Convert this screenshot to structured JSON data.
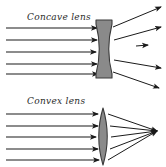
{
  "canvas": {
    "width": 166,
    "height": 167,
    "background": "#ffffff"
  },
  "style": {
    "ray_color": "#1a1a1a",
    "lens_fill": "#8a8a8a",
    "lens_stroke": "#3a3a3a",
    "label_color": "#2b2b2b"
  },
  "panels": [
    {
      "id": "concave",
      "label": "Concave lens",
      "lens_type": "biconcave",
      "behaviour": "diverging",
      "lens": {
        "x": 96,
        "y": 20,
        "width": 16,
        "height": 58
      },
      "incident_rays": [
        {
          "y": 28,
          "x_start": 6,
          "x_end": 97
        },
        {
          "y": 40,
          "x_start": 6,
          "x_end": 97
        },
        {
          "y": 52,
          "x_start": 6,
          "x_end": 96
        },
        {
          "y": 64,
          "x_start": 6,
          "x_end": 97
        },
        {
          "y": 74,
          "x_start": 6,
          "x_end": 98
        }
      ],
      "emergent_rays": [
        {
          "x1": 113,
          "y1": 27,
          "x2": 161,
          "y2": 7
        },
        {
          "x1": 114,
          "y1": 40,
          "x2": 161,
          "y2": 27
        },
        {
          "x1": 116,
          "y1": 47,
          "x2": 148,
          "y2": 45
        },
        {
          "x1": 114,
          "y1": 60,
          "x2": 161,
          "y2": 68
        },
        {
          "x1": 113,
          "y1": 72,
          "x2": 159,
          "y2": 88
        }
      ]
    },
    {
      "id": "convex",
      "label": "Convex lens",
      "lens_type": "biconvex",
      "behaviour": "converging",
      "lens": {
        "x": 95,
        "y": 108,
        "width": 16,
        "height": 57
      },
      "focal_point": {
        "x": 157,
        "y": 131
      },
      "incident_rays": [
        {
          "y": 114,
          "x_start": 6,
          "x_end": 98
        },
        {
          "y": 126,
          "x_start": 6,
          "x_end": 98
        },
        {
          "y": 137,
          "x_start": 6,
          "x_end": 96
        },
        {
          "y": 149,
          "x_start": 6,
          "x_end": 98
        },
        {
          "y": 160,
          "x_start": 6,
          "x_end": 99
        }
      ],
      "emergent_rays": [
        {
          "x1": 110,
          "y1": 114,
          "x2": 157,
          "y2": 131
        },
        {
          "x1": 111,
          "y1": 126,
          "x2": 157,
          "y2": 131
        },
        {
          "x1": 112,
          "y1": 137,
          "x2": 157,
          "y2": 131
        },
        {
          "x1": 111,
          "y1": 149,
          "x2": 157,
          "y2": 131
        },
        {
          "x1": 110,
          "y1": 160,
          "x2": 157,
          "y2": 131
        }
      ]
    }
  ]
}
